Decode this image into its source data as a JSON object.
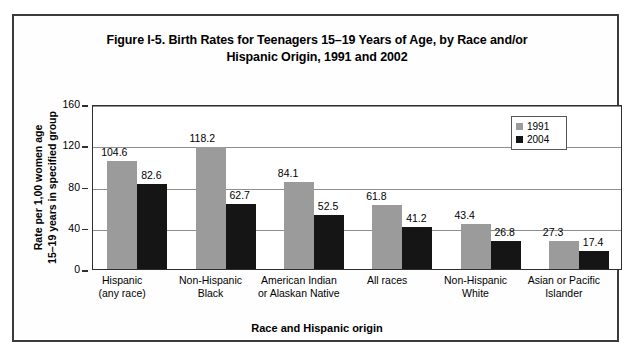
{
  "figure": {
    "title_line1": "Figure I-5. Birth Rates for Teenagers 15–19 Years of Age, by Race and/or",
    "title_line2": "Hispanic Origin, 1991 and 2002"
  },
  "chart_data": {
    "type": "bar",
    "title": "Figure I-5. Birth Rates for Teenagers 15–19 Years of Age, by Race and/or Hispanic Origin, 1991 and 2002",
    "xlabel": "Race and Hispanic origin",
    "ylabel": "Rate per 1,00 women age 15–19 years in specified group",
    "ylabel_line1": "Rate per 1,00 women age",
    "ylabel_line2": "15–19 years in specified group",
    "ylim": [
      0,
      160
    ],
    "yticks": [
      0,
      40,
      80,
      120,
      160
    ],
    "grid": true,
    "legend_position": "top-right",
    "categories": [
      "Hispanic\n(any race)",
      "Non-Hispanic\nBlack",
      "American Indian\nor Alaskan Native",
      "All races",
      "Non-Hispanic\nWhite",
      "Asian or Pacific\nIslander"
    ],
    "category_lines": [
      [
        "Hispanic",
        "(any race)"
      ],
      [
        "Non-Hispanic",
        "Black"
      ],
      [
        "American Indian",
        "or Alaskan Native"
      ],
      [
        "All races",
        ""
      ],
      [
        "Non-Hispanic",
        "White"
      ],
      [
        "Asian or Pacific",
        "Islander"
      ]
    ],
    "series": [
      {
        "name": "1991",
        "color": "#9b9b9b",
        "values": [
          104.6,
          118.2,
          84.1,
          61.8,
          43.4,
          27.3
        ],
        "labels": [
          "104.6",
          "118.2",
          "84.1",
          "61.8",
          "43.4",
          "27.3"
        ]
      },
      {
        "name": "2004",
        "color": "#151515",
        "values": [
          82.6,
          62.7,
          52.5,
          41.2,
          26.8,
          17.4
        ],
        "labels": [
          "82.6",
          "62.7",
          "52.5",
          "41.2",
          "26.8",
          "17.4"
        ]
      }
    ]
  },
  "legend": {
    "entries": [
      {
        "label": "1991",
        "color": "#9b9b9b"
      },
      {
        "label": "2004",
        "color": "#151515"
      }
    ]
  }
}
